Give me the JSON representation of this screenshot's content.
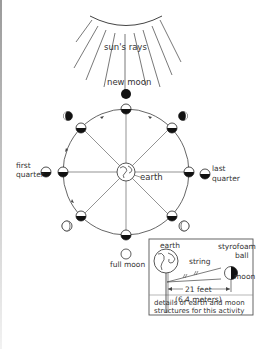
{
  "diagram": {
    "labels": {
      "suns_rays": "sun's rays",
      "new_moon": "new moon",
      "full_moon": "full moon",
      "first_quarter_line1": "first",
      "first_quarter_line2": "quarter",
      "last_quarter_line1": "last",
      "last_quarter_line2": "quarter",
      "earth": "earth"
    },
    "inset": {
      "earth": "earth",
      "string": "string",
      "styrofoam_line1": "styrofoam",
      "styrofoam_line2": "ball",
      "moon": "moon",
      "distance_feet": "21 feet",
      "distance_meters": "(6.4 meters)",
      "caption_line1": "details of earth and moon",
      "caption_line2": "structures for this activity"
    },
    "orbit_phases": [
      "new moon",
      "waxing crescent",
      "first quarter",
      "waxing gibbous",
      "full moon",
      "waning gibbous",
      "last quarter",
      "waning crescent"
    ],
    "colors": {
      "line": "#333333",
      "fill_dark": "#111111",
      "background": "#ffffff"
    }
  }
}
